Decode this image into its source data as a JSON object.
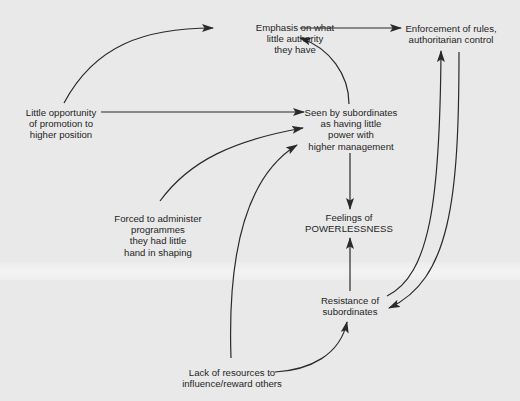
{
  "diagram": {
    "nodes": {
      "emphasis": {
        "lines": [
          "Emphasis on what",
          "little authority",
          "they have"
        ]
      },
      "enforcement": {
        "lines": [
          "Enforcement of rules,",
          "authoritarian control"
        ]
      },
      "little_opportunity": {
        "lines": [
          "Little opportunity",
          "of promotion to",
          "higher position"
        ]
      },
      "seen_by_subordinates": {
        "lines": [
          "Seen by subordinates",
          "as having little",
          "power with",
          "higher management"
        ]
      },
      "forced_to_administer": {
        "lines": [
          "Forced to administer",
          "programmes",
          "they had little",
          "hand in shaping"
        ]
      },
      "feelings": {
        "lines": [
          "Feelings of",
          "POWERLESSNESS"
        ]
      },
      "resistance": {
        "lines": [
          "Resistance of",
          "subordinates"
        ]
      },
      "lack_of_resources": {
        "lines": [
          "Lack of resources to",
          "influence/reward others"
        ]
      }
    },
    "edges": [
      {
        "from": "little_opportunity",
        "to": "emphasis"
      },
      {
        "from": "little_opportunity",
        "to": "seen_by_subordinates"
      },
      {
        "from": "emphasis",
        "to": "enforcement"
      },
      {
        "from": "seen_by_subordinates",
        "to": "emphasis"
      },
      {
        "from": "seen_by_subordinates",
        "to": "feelings"
      },
      {
        "from": "forced_to_administer",
        "to": "seen_by_subordinates"
      },
      {
        "from": "lack_of_resources",
        "to": "seen_by_subordinates"
      },
      {
        "from": "resistance",
        "to": "feelings"
      },
      {
        "from": "resistance",
        "to": "enforcement"
      },
      {
        "from": "enforcement",
        "to": "resistance"
      },
      {
        "from": "lack_of_resources",
        "to": "resistance"
      }
    ],
    "colors": {
      "background": "#e9e9e9",
      "band": "#f1f1f1",
      "line": "#2a2a2a",
      "text": "#1f1f1f"
    }
  }
}
